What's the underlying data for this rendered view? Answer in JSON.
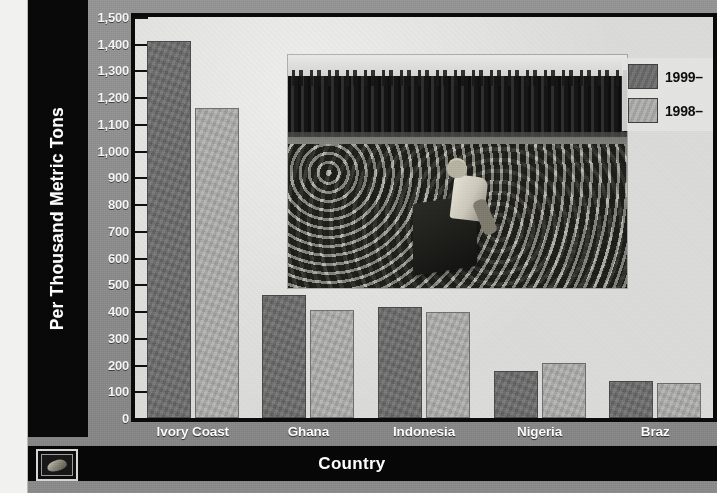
{
  "credit": {
    "text": "–Leigh Haeger; Source: International Cocoa Organization"
  },
  "axis": {
    "y_title": "Per Thousand Metric Tons",
    "x_title": "Country"
  },
  "legend": {
    "items": [
      {
        "label": "1999–",
        "color": "#6b6b6b",
        "series": "1999-"
      },
      {
        "label": "1998–",
        "color": "#a9a9a7",
        "series": "1998-"
      }
    ]
  },
  "logo": {
    "name": "cocoa-pod-badge"
  },
  "colors": {
    "series_1999": "#6b6b6b",
    "series_1998": "#a9a9a7",
    "panel_background": "#8e8e8e",
    "plot_background": "#dbdbd9",
    "band_black": "#080808",
    "label_white": "#fbfbfb"
  },
  "chart_data": {
    "type": "bar",
    "title": "",
    "xlabel": "Country",
    "ylabel": "Per Thousand Metric Tons",
    "ylim": [
      0,
      1500
    ],
    "ytick_step": 100,
    "yticks": [
      "0",
      "100",
      "200",
      "300",
      "400",
      "500",
      "600",
      "700",
      "800",
      "900",
      "1,000",
      "1,100",
      "1,200",
      "1,300",
      "1,400",
      "1,500"
    ],
    "grid": false,
    "legend_position": "top-right",
    "categories": [
      "Ivory Coast",
      "Ghana",
      "Indonesia",
      "Nigeria",
      "Braz"
    ],
    "series": [
      {
        "name": "1999–",
        "color": "#6b6b6b",
        "values": [
          1410,
          460,
          415,
          175,
          140
        ]
      },
      {
        "name": "1998–",
        "color": "#a9a9a7",
        "values": [
          1160,
          405,
          398,
          205,
          130
        ]
      }
    ]
  },
  "photo": {
    "caption": "cocoa-farm-worker-photo"
  }
}
